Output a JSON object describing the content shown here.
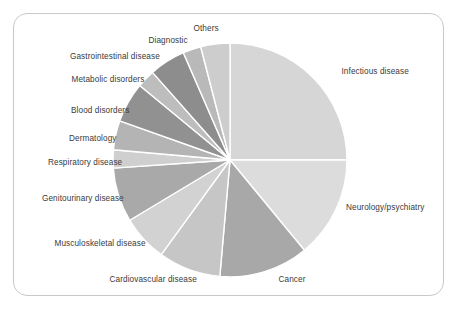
{
  "figure": {
    "title": "",
    "frame_color": "#c9c9c9",
    "background": "#ffffff",
    "label_color": "#3a3a3a"
  },
  "chart_data": {
    "type": "pie",
    "title": "",
    "xlabel": "",
    "ylabel": "",
    "legend_position": "none",
    "labels_placement": "outside-callout",
    "start_angle_deg": 0,
    "direction": "clockwise",
    "center": {
      "x": 230,
      "y": 160
    },
    "radius": 117,
    "categories": [
      "Infectious disease",
      "Neurology/psychiatry",
      "Cancer",
      "Cardiovascular disease",
      "Musculoskeletal disease",
      "Genitourinary disease",
      "Respiratory disease",
      "Dermatology",
      "Blood disorders",
      "Metabolic disorders",
      "Gastrointestinal disease",
      "Diagnostic",
      "Others"
    ],
    "values": [
      25.0,
      14.0,
      14.5,
      8.5,
      6.5,
      7.5,
      2.5,
      4.0,
      5.5,
      2.5,
      5.0,
      2.5,
      2.0
    ],
    "colors": [
      "#d6d6d6",
      "#dcdcdc",
      "#a8a8a8",
      "#c6c6c6",
      "#d2d2d2",
      "#a9a9a9",
      "#cfcfcf",
      "#b4b4b4",
      "#919191",
      "#bdbdbd",
      "#8d8d8d",
      "#b9b9b9",
      "#cdcdcd"
    ],
    "slice_edge_color": "#ffffff",
    "slice_edge_width": 1.4,
    "slices": [
      {
        "label": "Infectious disease",
        "value": 25.0,
        "start_deg": 0.0,
        "end_deg": 90.0,
        "color": "#d6d6d6"
      },
      {
        "label": "Neurology/psychiatry",
        "value": 14.0,
        "start_deg": 90.0,
        "end_deg": 140.5,
        "color": "#dcdcdc"
      },
      {
        "label": "Cancer",
        "value": 14.5,
        "start_deg": 140.5,
        "end_deg": 185.0,
        "color": "#a8a8a8"
      },
      {
        "label": "Cardiovascular disease",
        "value": 8.5,
        "start_deg": 185.0,
        "end_deg": 216.0,
        "color": "#c6c6c6"
      },
      {
        "label": "Musculoskeletal disease",
        "value": 6.5,
        "start_deg": 216.0,
        "end_deg": 239.0,
        "color": "#d2d2d2"
      },
      {
        "label": "Genitourinary disease",
        "value": 7.5,
        "start_deg": 239.0,
        "end_deg": 266.0,
        "color": "#a9a9a9"
      },
      {
        "label": "Respiratory disease",
        "value": 2.5,
        "start_deg": 266.0,
        "end_deg": 275.0,
        "color": "#cfcfcf"
      },
      {
        "label": "Dermatology",
        "value": 4.0,
        "start_deg": 275.0,
        "end_deg": 289.5,
        "color": "#b4b4b4"
      },
      {
        "label": "Blood disorders",
        "value": 5.5,
        "start_deg": 289.5,
        "end_deg": 309.5,
        "color": "#919191"
      },
      {
        "label": "Metabolic disorders",
        "value": 2.5,
        "start_deg": 309.5,
        "end_deg": 318.5,
        "color": "#bdbdbd"
      },
      {
        "label": "Gastrointestinal disease",
        "value": 5.0,
        "start_deg": 318.5,
        "end_deg": 336.5,
        "color": "#8d8d8d"
      },
      {
        "label": "Diagnostic",
        "value": 2.5,
        "start_deg": 336.5,
        "end_deg": 345.5,
        "color": "#b9b9b9"
      },
      {
        "label": "Others",
        "value": 2.0,
        "start_deg": 345.5,
        "end_deg": 360.0,
        "color": "#cdcdcd"
      }
    ]
  },
  "labels": [
    {
      "text": "Others",
      "x": 206,
      "y": 30,
      "align": "center"
    },
    {
      "text": "Diagnostic",
      "x": 168,
      "y": 42,
      "align": "center"
    },
    {
      "text": "Gastrointestinal disease",
      "x": 115,
      "y": 58,
      "align": "center"
    },
    {
      "text": "Metabolic disorders",
      "x": 108,
      "y": 81,
      "align": "center"
    },
    {
      "text": "Blood disorders",
      "x": 100,
      "y": 112,
      "align": "center"
    },
    {
      "text": "Dermatology",
      "x": 93,
      "y": 140,
      "align": "center"
    },
    {
      "text": "Respiratory disease",
      "x": 85,
      "y": 164,
      "align": "center"
    },
    {
      "text": "Genitourinary disease",
      "x": 83,
      "y": 200,
      "align": "center"
    },
    {
      "text": "Musculoskeletal disease",
      "x": 100,
      "y": 245,
      "align": "center"
    },
    {
      "text": "Cardiovascular disease",
      "x": 153,
      "y": 281,
      "align": "center"
    },
    {
      "text": "Cancer",
      "x": 292,
      "y": 281,
      "align": "center"
    },
    {
      "text": "Neurology/psychiatry",
      "x": 385,
      "y": 209,
      "align": "center"
    },
    {
      "text": "Infectious disease",
      "x": 375,
      "y": 73,
      "align": "center"
    }
  ]
}
